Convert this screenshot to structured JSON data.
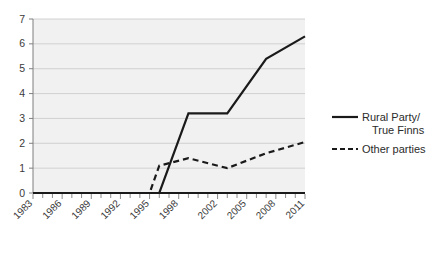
{
  "chart_data": {
    "type": "line",
    "title": "",
    "subtitle": "",
    "xlabel": "",
    "ylabel": "",
    "ylim": [
      0,
      7
    ],
    "xlim": [
      1983,
      2011
    ],
    "grid": true,
    "legend_position": "right",
    "y_ticks": [
      "0",
      "1",
      "2",
      "3",
      "4",
      "5",
      "6",
      "7"
    ],
    "y_tick_values": [
      0,
      1,
      2,
      3,
      4,
      5,
      6,
      7
    ],
    "x_tick_labels": [
      "1983",
      "1986",
      "1989",
      "1992",
      "1995",
      "1998",
      "2002",
      "2005",
      "2008",
      "2011"
    ],
    "x_tick_values": [
      1983,
      1986,
      1989,
      1992,
      1995,
      1998,
      2002,
      2005,
      2008,
      2011
    ],
    "x_minor_ticks": [
      1984,
      1985,
      1987,
      1988,
      1990,
      1991,
      1993,
      1994,
      1996,
      1997,
      1999,
      2000,
      2001,
      2003,
      2004,
      2006,
      2007,
      2009,
      2010
    ],
    "series": [
      {
        "name": "Rural Party/\nTrue Finns",
        "style": "solid",
        "color": "#1a1a1a",
        "x": [
          1983,
          1986,
          1989,
          1992,
          1995,
          1996,
          1999,
          2003,
          2007,
          2011
        ],
        "values": [
          0.0,
          0.0,
          0.0,
          0.0,
          0.0,
          0.0,
          3.2,
          3.2,
          5.4,
          6.3
        ]
      },
      {
        "name": "Other parties",
        "style": "dashed",
        "color": "#1a1a1a",
        "x": [
          1983,
          1986,
          1989,
          1992,
          1995,
          1996,
          1999,
          2003,
          2007,
          2011
        ],
        "values": [
          0.0,
          0.0,
          0.0,
          0.0,
          0.0,
          1.1,
          1.4,
          1.0,
          1.6,
          2.05
        ]
      }
    ]
  },
  "legend": {
    "items": [
      {
        "label_line1": "Rural Party/",
        "label_line2": "True Finns",
        "marker": "solid-line-swatch"
      },
      {
        "label_line1": "Other parties",
        "label_line2": "",
        "marker": "dashed-line-swatch"
      }
    ]
  },
  "colors": {
    "line": "#1a1a1a",
    "grid": "#c8c8c8",
    "axis": "#7f7f7f",
    "plot_background": "#f1f1f1",
    "page_background": "#ffffff",
    "text": "#3a3a3a"
  }
}
